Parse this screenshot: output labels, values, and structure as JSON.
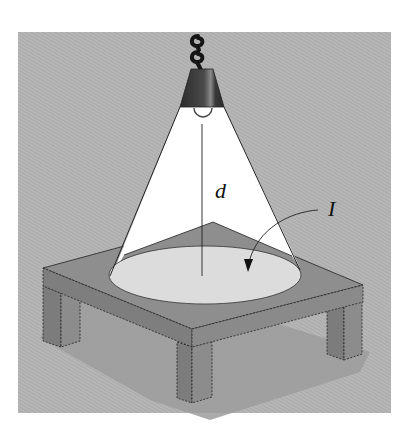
{
  "figure": {
    "labels": {
      "distance": "d",
      "intensity": "I"
    },
    "colors": {
      "background_panel": "#b4b4b4",
      "light_cone": "#ffffff",
      "lit_area": "#d8d8d8",
      "table_top": "#8e8e8e",
      "table_side_dark": "#7a7a7a",
      "table_side_light": "#8a8a8a",
      "shadow": "#9a9a9a",
      "lamp_shade": "#444444",
      "cord": "#1a1a1a",
      "outline": "#222222"
    }
  }
}
